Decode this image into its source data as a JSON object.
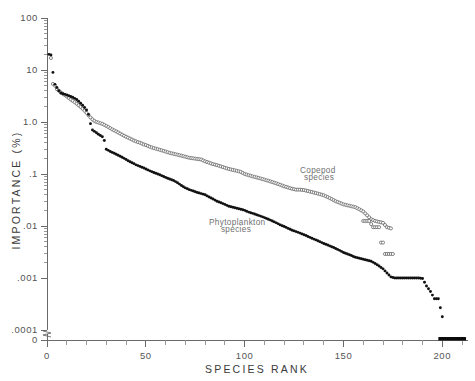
{
  "figure": {
    "background_color": "#ffffff",
    "axis_color": "#6a6a6a",
    "filled_marker_color": "#111111",
    "open_marker_edge_color": "#5f5f5f",
    "label_color": "#6f6f6f"
  },
  "chart_data": {
    "type": "scatter",
    "title": "",
    "xlabel": "SPECIES RANK",
    "ylabel": "IMPORTANCE (%)",
    "yscale": "log",
    "xscale": "linear",
    "xlim": [
      0,
      213
    ],
    "ylim": [
      0.0001,
      100
    ],
    "grid": false,
    "legend_position": "inline-annotation",
    "y_tick_labels": [
      "100",
      "10",
      "1.0",
      ".1",
      ".01",
      ".001",
      ".0001",
      "0"
    ],
    "y_tick_values": [
      100,
      10,
      1.0,
      0.1,
      0.01,
      0.001,
      0.0001,
      0
    ],
    "y_axis_break_note": "axis broken between .0001 and 0",
    "x_tick_labels": [
      "0",
      "50",
      "100",
      "150",
      "200"
    ],
    "x_tick_values": [
      0,
      50,
      100,
      150,
      200
    ],
    "x_minor_tick_interval": 10,
    "annotations": [
      {
        "text": "Copepod",
        "x": 128,
        "y": 0.105
      },
      {
        "text": "species",
        "x": 130,
        "y": 0.075
      },
      {
        "text": "Phytoplankton",
        "x": 82,
        "y": 0.0105
      },
      {
        "text": "species",
        "x": 88,
        "y": 0.0078
      }
    ],
    "series": [
      {
        "name": "Copepod species",
        "marker": "open-circle",
        "marker_size": 3.1,
        "x": [
          2,
          3,
          4,
          5,
          6,
          7,
          8,
          9,
          10,
          11,
          12,
          13,
          14,
          15,
          16,
          17,
          18,
          19,
          20,
          21,
          22,
          23,
          24,
          25,
          26,
          27,
          28,
          29,
          30,
          31,
          32,
          33,
          34,
          35,
          36,
          37,
          38,
          39,
          40,
          41,
          42,
          43,
          44,
          45,
          46,
          47,
          48,
          49,
          50,
          52,
          54,
          56,
          58,
          60,
          62,
          64,
          66,
          68,
          70,
          72,
          74,
          76,
          78,
          80,
          82,
          84,
          86,
          88,
          90,
          92,
          94,
          96,
          98,
          100,
          102,
          104,
          106,
          108,
          110,
          112,
          114,
          116,
          118,
          120,
          122,
          124,
          126,
          128,
          130,
          132,
          134,
          136,
          138,
          140,
          142,
          144,
          146,
          148,
          150,
          152,
          154,
          156,
          158,
          160,
          162,
          164,
          166,
          168,
          170,
          172,
          174
        ],
        "y": [
          17.0,
          5.4,
          5.0,
          4.3,
          4.0,
          3.7,
          3.5,
          3.3,
          3.1,
          2.9,
          2.7,
          2.55,
          2.4,
          2.25,
          2.1,
          1.95,
          1.8,
          1.65,
          1.5,
          1.35,
          1.22,
          1.12,
          1.05,
          1.0,
          0.98,
          0.95,
          0.92,
          0.88,
          0.84,
          0.8,
          0.76,
          0.72,
          0.69,
          0.66,
          0.63,
          0.6,
          0.57,
          0.545,
          0.52,
          0.5,
          0.48,
          0.46,
          0.44,
          0.425,
          0.41,
          0.4,
          0.385,
          0.37,
          0.36,
          0.335,
          0.315,
          0.3,
          0.285,
          0.27,
          0.255,
          0.245,
          0.235,
          0.225,
          0.215,
          0.205,
          0.2,
          0.195,
          0.19,
          0.175,
          0.165,
          0.155,
          0.148,
          0.14,
          0.132,
          0.125,
          0.12,
          0.115,
          0.11,
          0.1,
          0.095,
          0.09,
          0.086,
          0.082,
          0.078,
          0.074,
          0.07,
          0.066,
          0.062,
          0.058,
          0.055,
          0.052,
          0.05,
          0.05,
          0.049,
          0.047,
          0.045,
          0.043,
          0.041,
          0.039,
          0.036,
          0.033,
          0.03,
          0.028,
          0.026,
          0.025,
          0.024,
          0.023,
          0.021,
          0.019,
          0.016,
          0.0135,
          0.0125,
          0.012,
          0.0115,
          0.0095,
          0.009
        ]
      },
      {
        "name": "Copepod species tail",
        "marker": "open-circle",
        "marker_size": 3.1,
        "x": [
          160,
          161,
          162,
          163,
          165,
          166,
          167,
          168,
          169,
          170,
          171,
          172,
          173,
          174,
          175
        ],
        "y": [
          0.0125,
          0.0125,
          0.0125,
          0.0125,
          0.0095,
          0.0095,
          0.0095,
          0.0095,
          0.0048,
          0.0048,
          0.0029,
          0.0029,
          0.0029,
          0.0029,
          0.0029
        ]
      },
      {
        "name": "Phytoplankton species",
        "marker": "filled-circle",
        "marker_size": 2.9,
        "x": [
          1,
          2,
          3,
          4,
          5,
          6,
          7,
          8,
          9,
          10,
          11,
          12,
          13,
          14,
          15,
          16,
          17,
          18,
          19,
          20,
          21,
          22,
          23,
          24,
          25,
          26,
          27,
          28,
          29,
          30,
          31,
          32,
          33,
          34,
          35,
          36,
          37,
          38,
          39,
          40,
          41,
          42,
          43,
          44,
          45,
          46,
          47,
          48,
          49,
          50,
          52,
          54,
          56,
          58,
          60,
          62,
          64,
          66,
          68,
          70,
          72,
          74,
          76,
          78,
          80,
          82,
          84,
          86,
          88,
          90,
          92,
          94,
          96,
          98,
          100,
          102,
          104,
          106,
          108,
          110,
          112,
          114,
          116,
          118,
          120,
          122,
          124,
          126,
          128,
          130,
          132,
          134,
          136,
          138,
          140,
          142,
          144,
          146,
          148,
          150,
          152,
          154,
          156,
          158,
          160,
          162,
          164,
          166,
          168,
          170,
          172,
          174,
          176,
          178,
          180,
          182,
          184,
          186,
          188,
          190,
          192,
          194,
          196,
          198,
          200
        ],
        "y": [
          20.0,
          19.5,
          9.0,
          5.3,
          4.6,
          4.0,
          3.6,
          3.5,
          3.4,
          3.3,
          3.2,
          3.1,
          3.0,
          2.85,
          2.7,
          2.5,
          2.3,
          2.1,
          1.9,
          1.7,
          1.4,
          0.93,
          0.7,
          0.66,
          0.62,
          0.58,
          0.55,
          0.52,
          0.44,
          0.3,
          0.285,
          0.27,
          0.26,
          0.25,
          0.24,
          0.23,
          0.22,
          0.21,
          0.2,
          0.19,
          0.18,
          0.172,
          0.165,
          0.158,
          0.15,
          0.145,
          0.14,
          0.135,
          0.13,
          0.125,
          0.115,
          0.107,
          0.1,
          0.093,
          0.086,
          0.08,
          0.075,
          0.068,
          0.06,
          0.054,
          0.05,
          0.047,
          0.044,
          0.042,
          0.04,
          0.036,
          0.033,
          0.03,
          0.028,
          0.026,
          0.024,
          0.023,
          0.022,
          0.021,
          0.02,
          0.0185,
          0.0175,
          0.0165,
          0.0155,
          0.0145,
          0.0135,
          0.0125,
          0.0115,
          0.0105,
          0.0098,
          0.009,
          0.0083,
          0.0078,
          0.0073,
          0.0068,
          0.0063,
          0.0058,
          0.0054,
          0.005,
          0.0046,
          0.0043,
          0.004,
          0.0037,
          0.0034,
          0.0031,
          0.0029,
          0.0027,
          0.0025,
          0.0024,
          0.0023,
          0.0022,
          0.0021,
          0.0019,
          0.0017,
          0.0015,
          0.00125,
          0.00105,
          0.001,
          0.001,
          0.001,
          0.001,
          0.001,
          0.001,
          0.001,
          0.00098,
          0.0007,
          0.00055,
          0.0004,
          0.0004,
          0.00018
        ]
      },
      {
        "name": "Phytoplankton zero-importance species",
        "marker": "bar",
        "note": "solid black bar along the zero line",
        "x_start": 198,
        "x_end": 212,
        "y": 0
      }
    ]
  },
  "axes": {
    "y_title": "IMPORTANCE (%)",
    "x_title": "SPECIES RANK"
  }
}
